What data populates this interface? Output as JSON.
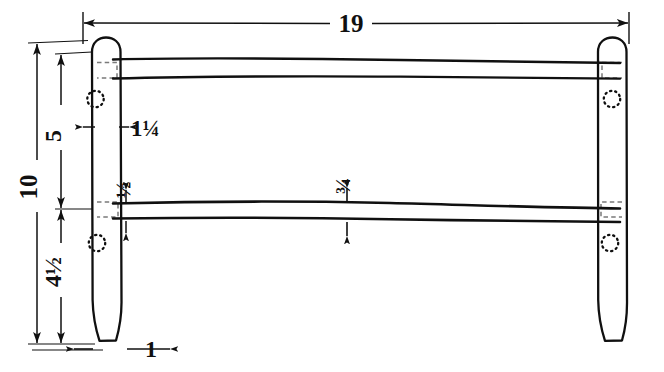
{
  "drawing": {
    "title": "Hand-drawn woodworking elevation: two vertical stiles joined by two horizontal rails",
    "type": "technical-sketch",
    "units": "inches",
    "background_color": "#ffffff",
    "ink_color": "#101010",
    "dimensions": [
      {
        "id": "overall-width",
        "label": "19",
        "orientation": "horizontal",
        "position": "top",
        "value": 19,
        "describes": "overall outside width of the assembly"
      },
      {
        "id": "overall-height",
        "label": "10",
        "orientation": "vertical",
        "position": "left-outer",
        "value": 10,
        "rotated": true,
        "describes": "overall height of the stile"
      },
      {
        "id": "upper-section-height",
        "label": "5",
        "orientation": "vertical",
        "position": "left-inner",
        "value": 5,
        "rotated": true,
        "describes": "top of stile down to the middle rail"
      },
      {
        "id": "lower-section-height",
        "label": "4½",
        "orientation": "vertical",
        "position": "left-inner-lower",
        "value": 4.5,
        "rotated": true,
        "describes": "middle rail down to the bottom of the stile"
      },
      {
        "id": "stile-width-upper",
        "label": "1¼",
        "orientation": "horizontal",
        "position": "left-stile-upper",
        "value": 1.25,
        "describes": "width of the stile at the upper section"
      },
      {
        "id": "rail-thickness-left",
        "label": "½",
        "orientation": "vertical",
        "position": "middle-rail-left",
        "value": 0.5,
        "rotated": true,
        "describes": "thickness of the middle rail at the joint"
      },
      {
        "id": "rail-thickness-center",
        "label": "¾",
        "orientation": "vertical",
        "position": "middle-rail-center",
        "value": 0.75,
        "rotated": true,
        "describes": "thickness of the middle rail at mid-span"
      },
      {
        "id": "stile-width-bottom",
        "label": "1",
        "orientation": "horizontal",
        "position": "bottom",
        "value": 1,
        "describes": "width of the stile foot at the bottom"
      }
    ],
    "features": [
      {
        "id": "left-stile",
        "name": "left-stile",
        "shape": "tapered post with rounded top"
      },
      {
        "id": "right-stile",
        "name": "right-stile",
        "shape": "tapered post with rounded top"
      },
      {
        "id": "top-rail",
        "name": "top-rail",
        "shape": "horizontal hand-drawn rail"
      },
      {
        "id": "middle-rail",
        "name": "middle-rail",
        "shape": "horizontal hand-drawn rail"
      },
      {
        "id": "peg-hole-left-upper",
        "name": "peg-hole",
        "style": "dotted circle (hidden)"
      },
      {
        "id": "peg-hole-left-lower",
        "name": "peg-hole",
        "style": "dotted circle (hidden)"
      },
      {
        "id": "peg-hole-right-upper",
        "name": "peg-hole",
        "style": "dotted circle (hidden)"
      },
      {
        "id": "peg-hole-right-lower",
        "name": "peg-hole",
        "style": "dotted circle (hidden)"
      },
      {
        "id": "mortise-left-upper",
        "name": "mortise-joint",
        "style": "dashed rectangle (hidden)"
      },
      {
        "id": "mortise-left-lower",
        "name": "mortise-joint",
        "style": "dashed rectangle (hidden)"
      },
      {
        "id": "mortise-right-upper",
        "name": "mortise-joint",
        "style": "dashed rectangle (hidden)"
      },
      {
        "id": "mortise-right-lower",
        "name": "mortise-joint",
        "style": "dashed rectangle (hidden)"
      }
    ]
  }
}
